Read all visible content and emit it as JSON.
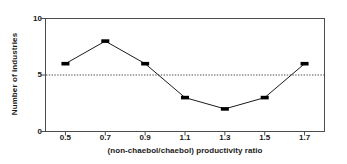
{
  "chart_data": {
    "type": "line",
    "title": "",
    "subtitle": "",
    "xlabel": "(non-chaebol/chaebol) productivity ratio",
    "ylabel": "Number of industries",
    "categories": [
      "0.5",
      "0.7",
      "0.9",
      "1.1",
      "1.3",
      "1.5",
      "1.7"
    ],
    "x": [
      0.5,
      0.7,
      0.9,
      1.1,
      1.3,
      1.5,
      1.7
    ],
    "values": [
      6,
      8,
      6,
      3,
      2,
      3,
      6
    ],
    "series": [
      {
        "name": "Number of industries",
        "values": [
          6,
          8,
          6,
          3,
          2,
          3,
          6
        ]
      }
    ],
    "xlim": [
      0.4,
      1.8
    ],
    "ylim": [
      0,
      10
    ],
    "yticks": [
      "0",
      "5",
      "10"
    ],
    "ytick_values": [
      0,
      5,
      10
    ],
    "xticks": [
      "0.5",
      "0.7",
      "0.9",
      "1.1",
      "1.3",
      "1.5",
      "1.7"
    ],
    "grid": false,
    "legend": "none",
    "annotations": [
      {
        "kind": "reference-line",
        "orientation": "horizontal",
        "value": 5,
        "style": "dotted"
      }
    ],
    "marker": "square",
    "line_color": "#1a1a1a",
    "marker_color": "#000000",
    "reference_line_color": "#4d4d4d",
    "axis_color": "#4d4d4d",
    "background": "#ffffff"
  }
}
